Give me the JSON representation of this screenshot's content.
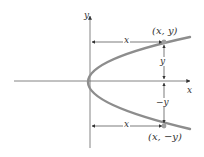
{
  "figure": {
    "type": "parabola-symmetry-diagram",
    "colors": {
      "curve": "#8a8a8a",
      "axes": "#555555",
      "arrows": "#444444",
      "points": "#9a9a9a",
      "text": "#333333"
    }
  },
  "axes": {
    "x_label": "x",
    "y_label": "y"
  },
  "points": [
    {
      "id": "upper",
      "label": "(x, y)"
    },
    {
      "id": "lower",
      "label": "(x, −y)"
    }
  ],
  "dimensions": {
    "upper_horizontal": "x",
    "lower_horizontal": "x",
    "upper_vertical": "y",
    "lower_vertical": "−y"
  }
}
